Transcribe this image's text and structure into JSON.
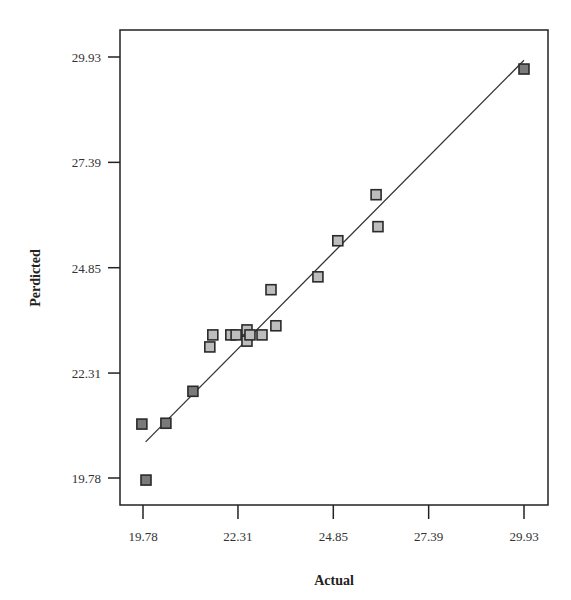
{
  "chart_data": {
    "type": "scatter",
    "title": "",
    "xlabel": "Actual",
    "ylabel": "Perdicted",
    "xlim": [
      19.78,
      29.93
    ],
    "ylim": [
      19.78,
      29.93
    ],
    "x_ticks": [
      "19.78",
      "22.31",
      "24.85",
      "27.39",
      "29.93"
    ],
    "y_ticks": [
      "19.78",
      "22.31",
      "24.85",
      "27.39",
      "29.93"
    ],
    "grid": false,
    "legend": null,
    "series": [
      {
        "name": "Design points",
        "marker": "square",
        "points": [
          {
            "x": 19.75,
            "y": 21.08,
            "shade": "dark"
          },
          {
            "x": 19.86,
            "y": 19.73,
            "shade": "dark"
          },
          {
            "x": 20.39,
            "y": 21.1,
            "shade": "dark"
          },
          {
            "x": 21.11,
            "y": 21.87,
            "shade": "dark"
          },
          {
            "x": 21.56,
            "y": 22.94,
            "shade": "light"
          },
          {
            "x": 21.64,
            "y": 23.23,
            "shade": "light"
          },
          {
            "x": 22.12,
            "y": 23.23,
            "shade": "light"
          },
          {
            "x": 22.26,
            "y": 23.23,
            "shade": "light"
          },
          {
            "x": 22.55,
            "y": 23.35,
            "shade": "light"
          },
          {
            "x": 22.55,
            "y": 23.08,
            "shade": "light"
          },
          {
            "x": 22.63,
            "y": 23.23,
            "shade": "light"
          },
          {
            "x": 22.95,
            "y": 23.23,
            "shade": "light"
          },
          {
            "x": 23.19,
            "y": 24.32,
            "shade": "light"
          },
          {
            "x": 23.32,
            "y": 23.45,
            "shade": "light"
          },
          {
            "x": 24.44,
            "y": 24.63,
            "shade": "light"
          },
          {
            "x": 24.97,
            "y": 25.5,
            "shade": "light"
          },
          {
            "x": 25.99,
            "y": 26.61,
            "shade": "light"
          },
          {
            "x": 26.04,
            "y": 25.84,
            "shade": "light"
          },
          {
            "x": 29.93,
            "y": 29.64,
            "shade": "dark"
          }
        ]
      }
    ],
    "reference_line": {
      "type": "y=x fit",
      "from": {
        "x": 19.85,
        "y": 20.65
      },
      "to": {
        "x": 29.93,
        "y": 29.85
      }
    }
  },
  "colors": {
    "axis": "#222222",
    "marker_dark_fill": "#7a7a7a",
    "marker_light_fill": "#bdbdbd",
    "marker_stroke": "#2a2a2a",
    "line": "#333333"
  }
}
